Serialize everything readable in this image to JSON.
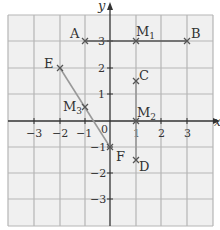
{
  "diagram": {
    "axes": {
      "x_label": "x",
      "y_label": "y",
      "x_ticks": [
        "−3",
        "−2",
        "−1",
        "1",
        "2",
        "3"
      ],
      "y_ticks": [
        "3",
        "2",
        "1",
        "−1",
        "−2",
        "−3"
      ],
      "origin_label": "0"
    },
    "points": [
      {
        "name": "A",
        "x": -1,
        "y": 3
      },
      {
        "name": "B",
        "x": 3,
        "y": 3
      },
      {
        "name": "M1",
        "x": 1,
        "y": 3
      },
      {
        "name": "C",
        "x": 1,
        "y": 1.5
      },
      {
        "name": "M2",
        "x": 1,
        "y": 0
      },
      {
        "name": "D",
        "x": 1,
        "y": -1.5
      },
      {
        "name": "E",
        "x": -2,
        "y": 2
      },
      {
        "name": "M3",
        "x": -1,
        "y": 0.5
      },
      {
        "name": "F",
        "x": 0,
        "y": -1
      }
    ],
    "segments": [
      {
        "from": "A",
        "to": "B",
        "color": "#555555"
      },
      {
        "from": "C",
        "to": "D",
        "color": "#999999"
      },
      {
        "from": "E",
        "to": "F",
        "color": "#999999"
      }
    ],
    "colors": {
      "grid_bg": "#f0f0f0",
      "grid_line": "#b0b0b0",
      "axis": "#333333"
    }
  }
}
